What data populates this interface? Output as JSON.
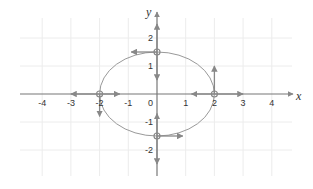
{
  "chart_data": {
    "type": "diagram",
    "title": "",
    "xlabel": "x",
    "ylabel": "y",
    "xlim": [
      -4.5,
      4.8
    ],
    "ylim": [
      -2.8,
      2.8
    ],
    "grid": true,
    "x_ticks": [
      "-4",
      "-3",
      "-2",
      "-1",
      "1",
      "2",
      "3",
      "4"
    ],
    "y_ticks": [
      "2",
      "1",
      "-1",
      "-2"
    ],
    "origin_label": "0",
    "curve": {
      "kind": "ellipse",
      "center": [
        0,
        0
      ],
      "rx": 2,
      "ry": 1.5
    },
    "points": [
      {
        "x": -2,
        "y": 0,
        "vectors": [
          [
            -1,
            0
          ],
          [
            0.7,
            0
          ],
          [
            0,
            -0.8
          ]
        ]
      },
      {
        "x": 2,
        "y": 0,
        "vectors": [
          [
            0,
            1
          ],
          [
            -0.8,
            0
          ],
          [
            1,
            0
          ]
        ]
      },
      {
        "x": 0,
        "y": 1.5,
        "vectors": [
          [
            -0.9,
            0
          ],
          [
            0,
            1
          ],
          [
            0,
            -1
          ]
        ]
      },
      {
        "x": 0,
        "y": -1.5,
        "vectors": [
          [
            0.9,
            0
          ],
          [
            0,
            0.8
          ],
          [
            0,
            -1
          ]
        ]
      }
    ],
    "colors": {
      "axis": "#777777",
      "grid": "#ececec",
      "curve": "#999999",
      "arrow": "#888888",
      "text": "#333333"
    }
  }
}
